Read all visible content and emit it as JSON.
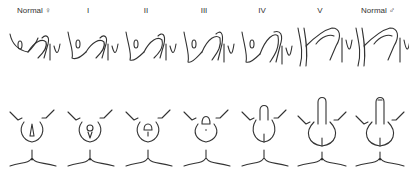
{
  "diagram": {
    "title": "",
    "stages": [
      {
        "label": "Normal ♀",
        "id": "normal-female"
      },
      {
        "label": "I",
        "id": "stage-1"
      },
      {
        "label": "II",
        "id": "stage-2"
      },
      {
        "label": "III",
        "id": "stage-3"
      },
      {
        "label": "IV",
        "id": "stage-4"
      },
      {
        "label": "V",
        "id": "stage-5"
      },
      {
        "label": "Normal ♂",
        "id": "normal-male"
      }
    ],
    "rows": [
      {
        "name": "sagittal-section"
      },
      {
        "name": "external-view"
      }
    ]
  }
}
